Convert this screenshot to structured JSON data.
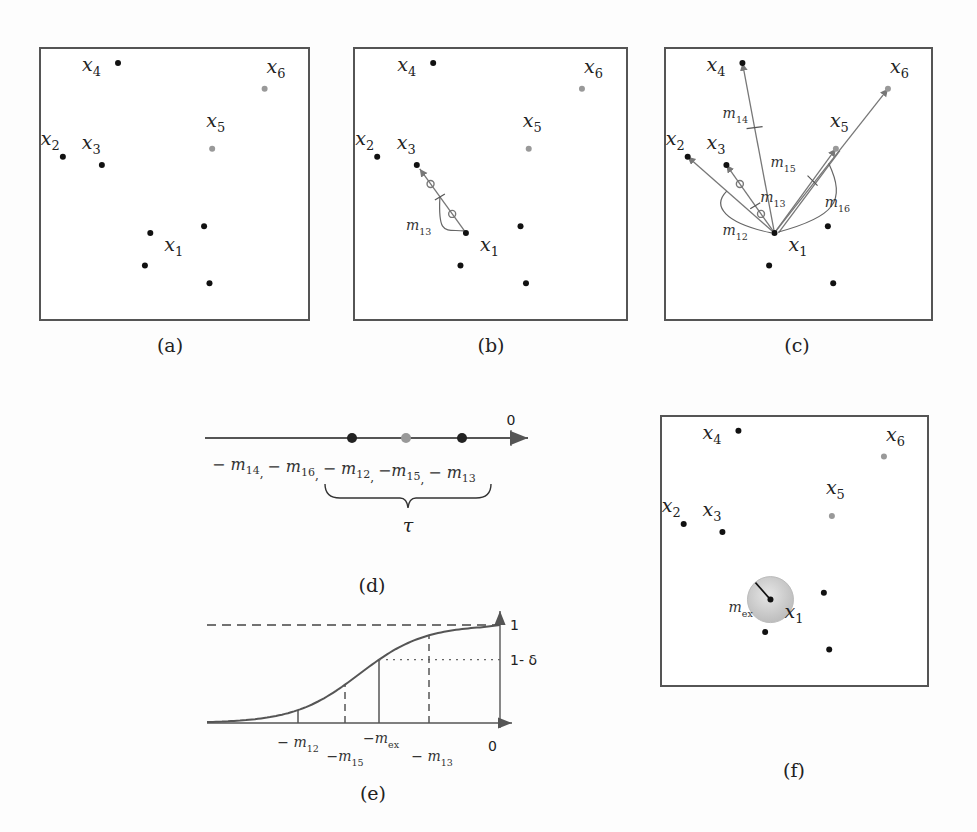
{
  "figure": {
    "panels": [
      {
        "id": "a",
        "caption": "(a)"
      },
      {
        "id": "b",
        "caption": "(b)"
      },
      {
        "id": "c",
        "caption": "(c)"
      },
      {
        "id": "d",
        "caption": "(d)"
      },
      {
        "id": "e",
        "caption": "(e)"
      },
      {
        "id": "f",
        "caption": "(f)"
      }
    ],
    "points": [
      {
        "name": "x1",
        "base": "x",
        "sub": "1",
        "color": "#111111",
        "labeled": true
      },
      {
        "name": "x2",
        "base": "x",
        "sub": "2",
        "color": "#111111",
        "labeled": true
      },
      {
        "name": "x3",
        "base": "x",
        "sub": "3",
        "color": "#111111",
        "labeled": true
      },
      {
        "name": "x4",
        "base": "x",
        "sub": "4",
        "color": "#111111",
        "labeled": true
      },
      {
        "name": "x5",
        "base": "x",
        "sub": "5",
        "color": "#999999",
        "labeled": true
      },
      {
        "name": "x6",
        "base": "x",
        "sub": "6",
        "color": "#999999",
        "labeled": true
      },
      {
        "name": "p7",
        "color": "#111111",
        "labeled": false
      },
      {
        "name": "p8",
        "color": "#111111",
        "labeled": false
      },
      {
        "name": "p9",
        "color": "#111111",
        "labeled": false
      }
    ],
    "margins_b": [
      {
        "base": "m",
        "sub": "13"
      }
    ],
    "margins_c": [
      {
        "base": "m",
        "sub": "14"
      },
      {
        "base": "m",
        "sub": "13"
      },
      {
        "base": "m",
        "sub": "12"
      },
      {
        "base": "m",
        "sub": "15"
      },
      {
        "base": "m",
        "sub": "16"
      }
    ],
    "number_line": {
      "zero_label": "0",
      "labels": [
        "− m",
        "14",
        ",",
        "− m",
        "16",
        ",",
        "− m",
        "12",
        ",",
        "−m",
        "15",
        ",",
        "− m",
        "13"
      ],
      "order": [
        "-m14",
        "-m16",
        "-m12",
        "-m15",
        "-m13"
      ],
      "marked_points": [
        {
          "value": "-m12",
          "color": "#222222"
        },
        {
          "value": "-m15",
          "color": "#999999"
        },
        {
          "value": "-m13",
          "color": "#222222"
        }
      ],
      "brace_label": "τ"
    },
    "cdf_plot": {
      "y_top_label": "1",
      "y_threshold_label": "1- δ",
      "x_zero_label": "0",
      "markers": [
        {
          "base": "− m",
          "sub": "12",
          "style": "solid-short"
        },
        {
          "base": "−m",
          "sub": "15",
          "style": "dashed"
        },
        {
          "base": "−m",
          "sub": "ex",
          "style": "solid"
        },
        {
          "base": "− m",
          "sub": "13",
          "style": "dashed"
        }
      ]
    },
    "panel_f": {
      "radius_label_base": "m",
      "radius_label_sub": "ex",
      "circle_color": "#c8c8c8"
    }
  }
}
